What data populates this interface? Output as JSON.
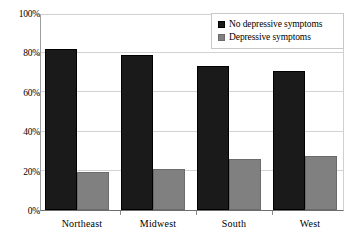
{
  "chart_data": {
    "type": "bar",
    "title": "",
    "subtitle": "",
    "xlabel": "",
    "ylabel": "",
    "categories": [
      "Northeast",
      "Midwest",
      "South",
      "West"
    ],
    "series": [
      {
        "name": "No depressive symptoms",
        "color": "#1a1a1a",
        "values": [
          81.5,
          78.5,
          73.0,
          70.5
        ]
      },
      {
        "name": "Depressive symptoms",
        "color": "#808080",
        "values": [
          19.5,
          21.0,
          26.0,
          27.5
        ]
      }
    ],
    "ylim": [
      0,
      100
    ],
    "yticks": [
      0,
      20,
      40,
      60,
      80,
      100
    ],
    "ytick_labels": [
      "0%",
      "20%",
      "40%",
      "60%",
      "80%",
      "100%"
    ],
    "grid": true,
    "grid_axis": "y",
    "legend_position": "top-right",
    "legend_entries": [
      {
        "label": "No depressive symptoms",
        "swatch": "dark"
      },
      {
        "label": "Depressive symptoms",
        "swatch": "light"
      }
    ],
    "annotations": []
  },
  "axes": {
    "y_tick_labels": [
      "100%",
      "80%",
      "60%",
      "40%",
      "20%",
      "0%"
    ],
    "x_tick_labels": [
      "Northeast",
      "Midwest",
      "South",
      "West"
    ]
  },
  "legend": {
    "items": [
      {
        "label": "No depressive symptoms"
      },
      {
        "label": "Depressive symptoms"
      }
    ]
  }
}
